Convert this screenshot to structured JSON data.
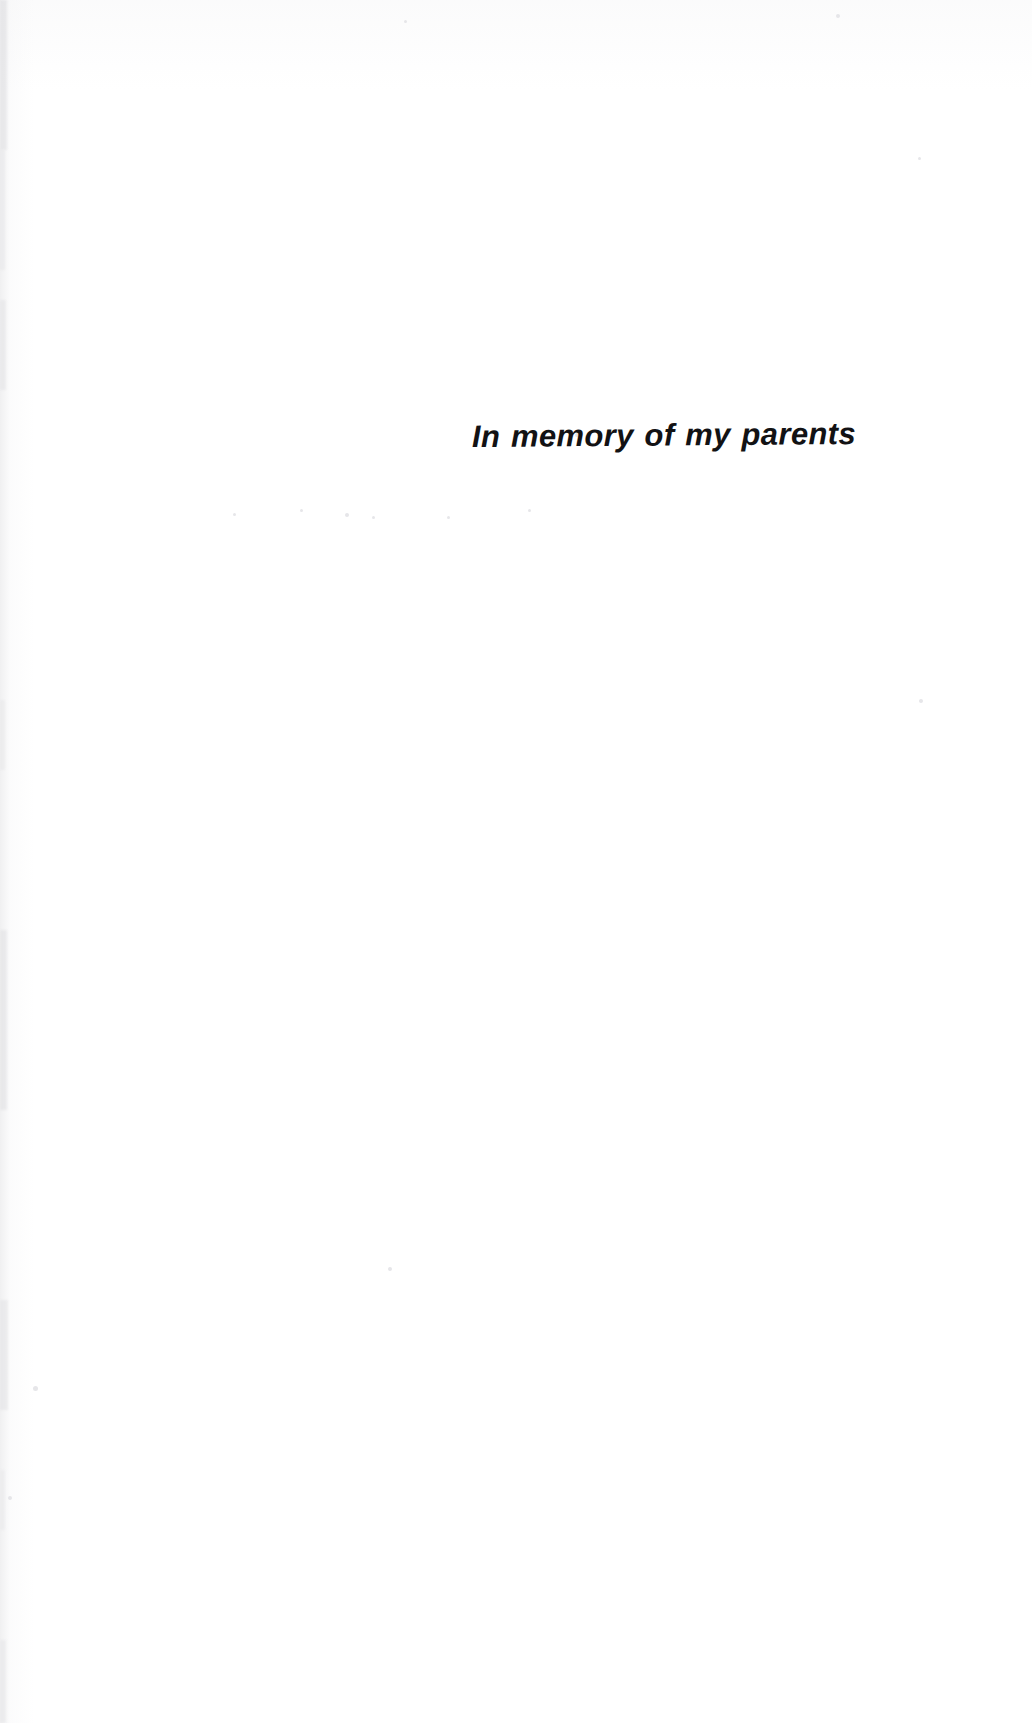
{
  "page": {
    "kind": "book-dedication-page",
    "background_color": "#ffffff",
    "width": 1032,
    "height": 1723
  },
  "dedication": {
    "text": "In memory of my parents",
    "color": "#121214",
    "alignment": "right",
    "style": "italic"
  },
  "artifacts": {
    "edge_color": "#d9d9dc",
    "speck_color": "#cfcfd3",
    "edge_marks": [
      {
        "top": 0,
        "height": 150,
        "width": 7,
        "opacity": 0.85
      },
      {
        "top": 150,
        "height": 120,
        "width": 5,
        "opacity": 0.55
      },
      {
        "top": 300,
        "height": 90,
        "width": 6,
        "opacity": 0.7
      },
      {
        "top": 700,
        "height": 70,
        "width": 5,
        "opacity": 0.5
      },
      {
        "top": 930,
        "height": 180,
        "width": 7,
        "opacity": 0.8
      },
      {
        "top": 1300,
        "height": 110,
        "width": 8,
        "opacity": 0.75
      },
      {
        "top": 1470,
        "height": 60,
        "width": 5,
        "opacity": 0.45
      },
      {
        "top": 1640,
        "height": 83,
        "width": 6,
        "opacity": 0.6
      }
    ],
    "specks": [
      {
        "left": 575,
        "top": 433,
        "size": 4,
        "tone": "faint"
      },
      {
        "left": 233,
        "top": 513,
        "size": 3,
        "tone": "faint"
      },
      {
        "left": 300,
        "top": 509,
        "size": 3,
        "tone": "faint"
      },
      {
        "left": 345,
        "top": 513,
        "size": 4,
        "tone": "faint"
      },
      {
        "left": 372,
        "top": 516,
        "size": 3,
        "tone": "faint"
      },
      {
        "left": 447,
        "top": 516,
        "size": 3,
        "tone": "faint"
      },
      {
        "left": 528,
        "top": 509,
        "size": 3,
        "tone": "faint"
      },
      {
        "left": 836,
        "top": 14,
        "size": 4,
        "tone": "faint"
      },
      {
        "left": 919,
        "top": 699,
        "size": 4,
        "tone": "faint"
      },
      {
        "left": 918,
        "top": 157,
        "size": 3,
        "tone": "faint"
      },
      {
        "left": 388,
        "top": 1267,
        "size": 4,
        "tone": "faint"
      },
      {
        "left": 33,
        "top": 1386,
        "size": 5,
        "tone": "faint"
      },
      {
        "left": 8,
        "top": 1496,
        "size": 4,
        "tone": "faint"
      },
      {
        "left": 404,
        "top": 20,
        "size": 3,
        "tone": "faint"
      }
    ]
  }
}
